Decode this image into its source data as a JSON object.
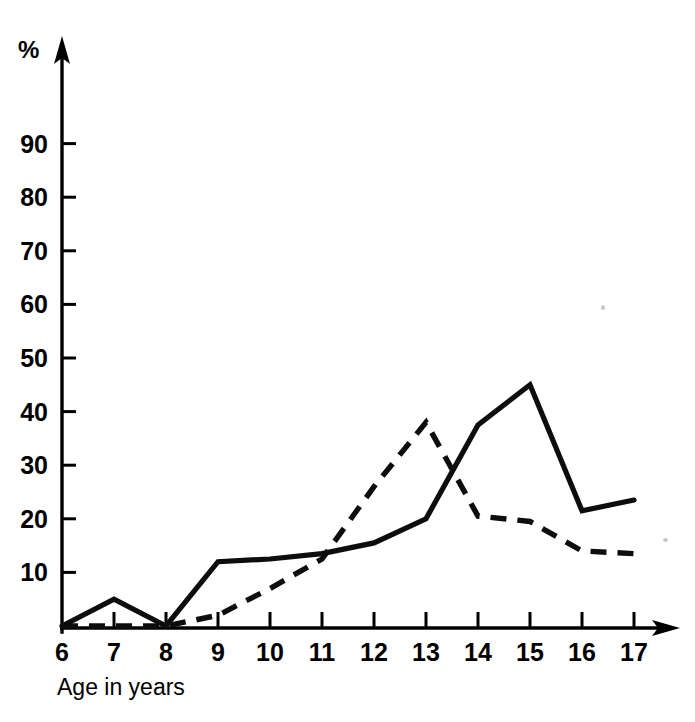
{
  "chart_data": {
    "type": "line",
    "title": "",
    "subtitle": "",
    "xlabel": "Age in years",
    "ylabel": "%",
    "x": [
      6,
      7,
      8,
      9,
      10,
      11,
      12,
      13,
      14,
      15,
      16,
      17
    ],
    "categories": [
      "6",
      "7",
      "8",
      "9",
      "10",
      "11",
      "12",
      "13",
      "14",
      "15",
      "16",
      "17"
    ],
    "xtick_labels": [
      "6",
      "7",
      "8",
      "9",
      "10",
      "11",
      "12",
      "13",
      "14",
      "15",
      "16",
      "17"
    ],
    "ytick_labels": [
      "10",
      "20",
      "30",
      "40",
      "50",
      "60",
      "70",
      "80",
      "90"
    ],
    "ytick_values": [
      10,
      20,
      30,
      40,
      50,
      60,
      70,
      80,
      90
    ],
    "xlim": [
      6,
      17
    ],
    "ylim": [
      0,
      100
    ],
    "grid": false,
    "legend": false,
    "legend_position": "none",
    "axis_style": "arrow-tipped L-axes",
    "series": [
      {
        "name": "solid-line",
        "style": "solid",
        "color": "#0d0d0d",
        "values": [
          0,
          5,
          0,
          12,
          12.5,
          13.5,
          15.5,
          20,
          37.5,
          45,
          21.5,
          23.5
        ]
      },
      {
        "name": "dashed-line",
        "style": "dashed",
        "color": "#0d0d0d",
        "values": [
          0,
          0,
          0,
          2,
          7,
          12.5,
          26,
          38,
          20.5,
          19.5,
          14,
          13.5
        ]
      }
    ],
    "annotations": []
  },
  "axes": {
    "y_unit": "%",
    "x_title": "Age in years"
  },
  "colors": {
    "ink": "#0d0d0d",
    "background": "#ffffff"
  }
}
